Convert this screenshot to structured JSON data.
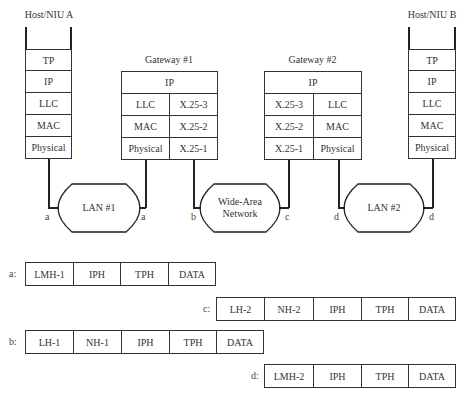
{
  "host_a": {
    "title": "Host/NIU A",
    "layers": [
      "TP",
      "IP",
      "LLC",
      "MAC",
      "Physical"
    ]
  },
  "gateway1": {
    "title": "Gateway #1",
    "top": "IP",
    "left": [
      "LLC",
      "MAC",
      "Physical"
    ],
    "right": [
      "X.25-3",
      "X.25-2",
      "X.25-1"
    ]
  },
  "gateway2": {
    "title": "Gateway #2",
    "top": "IP",
    "left": [
      "X.25-3",
      "X.25-2",
      "X.25-1"
    ],
    "right": [
      "LLC",
      "MAC",
      "Physical"
    ]
  },
  "host_b": {
    "title": "Host/NIU B",
    "layers": [
      "TP",
      "IP",
      "LLC",
      "MAC",
      "Physical"
    ]
  },
  "networks": {
    "lan1": "LAN #1",
    "wan_line1": "Wide-Area",
    "wan_line2": "Network",
    "lan2": "LAN #2"
  },
  "link_labels": {
    "a_left": "a",
    "a_right": "a",
    "b": "b",
    "c": "c",
    "d_left": "d",
    "d_right": "d"
  },
  "packets": {
    "a": {
      "label": "a:",
      "fields": [
        "LMH-1",
        "IPH",
        "TPH",
        "DATA"
      ]
    },
    "c": {
      "label": "c:",
      "fields": [
        "LH-2",
        "NH-2",
        "IPH",
        "TPH",
        "DATA"
      ]
    },
    "b": {
      "label": "b:",
      "fields": [
        "LH-1",
        "NH-1",
        "IPH",
        "TPH",
        "DATA"
      ]
    },
    "d": {
      "label": "d:",
      "fields": [
        "LMH-2",
        "IPH",
        "TPH",
        "DATA"
      ]
    }
  }
}
